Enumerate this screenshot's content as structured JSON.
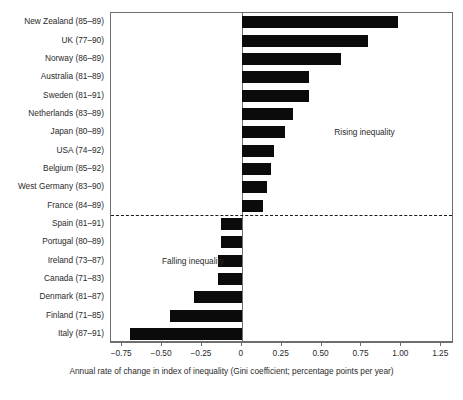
{
  "chart_data": {
    "type": "bar",
    "orientation": "horizontal",
    "title": "",
    "xlabel": "Annual rate of change in index of inequality (Gini coefficient; percentage points per year)",
    "ylabel": "",
    "xlim": [
      -0.82,
      1.33
    ],
    "xticks": [
      -0.75,
      -0.5,
      -0.25,
      0,
      0.25,
      0.5,
      0.75,
      1.0,
      1.25
    ],
    "xtick_labels": [
      "−0.75",
      "−0.50",
      "−0.25",
      "0",
      "0.25",
      "0.50",
      "0.75",
      "1.00",
      "1.25"
    ],
    "grid": false,
    "legend": null,
    "bar_color": "#0b0b0b",
    "categories": [
      "New Zealand (85–89)",
      "UK (77–90)",
      "Norway (86–89)",
      "Australia (81–89)",
      "Sweden (81–91)",
      "Netherlands (83–89)",
      "Japan (80–89)",
      "USA (74–92)",
      "Belgium (85–92)",
      "West Germany (83–90)",
      "France (84–89)",
      "Spain (81–91)",
      "Portugal (80–89)",
      "Ireland (73–87)",
      "Canada (71–83)",
      "Denmark (81–87)",
      "Finland (71–85)",
      "Italy (87–91)"
    ],
    "values": [
      0.98,
      0.79,
      0.62,
      0.42,
      0.42,
      0.32,
      0.27,
      0.2,
      0.18,
      0.16,
      0.13,
      -0.13,
      -0.13,
      -0.15,
      -0.15,
      -0.3,
      -0.45,
      -0.7
    ],
    "annotations": [
      {
        "text": "Rising inequality",
        "x": 0.58,
        "category_index": 6
      },
      {
        "text": "Falling inequality",
        "x": -0.5,
        "category_index": 13
      }
    ],
    "reference_lines": [
      {
        "type": "vertical",
        "x": 0,
        "style": "solid"
      },
      {
        "type": "horizontal",
        "between": [
          "France (84–89)",
          "Spain (81–91)"
        ],
        "style": "dashed",
        "label": "rising / falling divider"
      }
    ]
  }
}
